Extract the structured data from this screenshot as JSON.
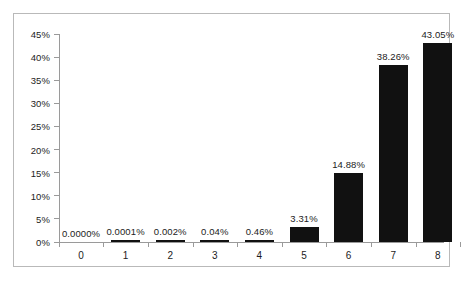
{
  "chart_data": {
    "type": "bar",
    "title": "",
    "subtitle": "",
    "xlabel": "",
    "ylabel": "",
    "categories": [
      "0",
      "1",
      "2",
      "3",
      "4",
      "5",
      "6",
      "7",
      "8"
    ],
    "values": [
      0.0,
      0.0001,
      0.002,
      0.04,
      0.46,
      3.31,
      14.88,
      38.26,
      43.05
    ],
    "data_labels": [
      "0.0000%",
      "0.0001%",
      "0.002%",
      "0.04%",
      "0.46%",
      "3.31%",
      "14.88%",
      "38.26%",
      "43.05%"
    ],
    "ylim": [
      0,
      45
    ],
    "ytick_values": [
      0,
      5,
      10,
      15,
      20,
      25,
      30,
      35,
      40,
      45
    ],
    "ytick_labels": [
      "0%",
      "5%",
      "10%",
      "15%",
      "20%",
      "25%",
      "30%",
      "35%",
      "40%",
      "45%"
    ],
    "grid": false,
    "legend": false,
    "legend_position": "none",
    "bar_color": "#111111",
    "axis_color": "#9a9a9a",
    "text_color": "#1c1c1c",
    "frame_color": "#b9b9b9",
    "background_color": "#ffffff"
  }
}
